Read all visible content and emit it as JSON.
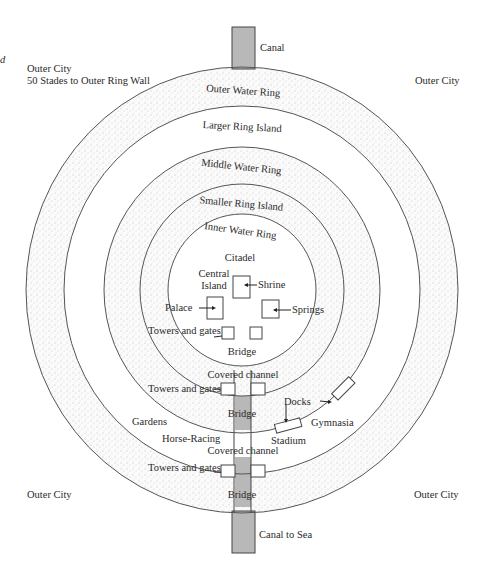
{
  "diagram": {
    "title_fragment": "d",
    "labels": {
      "outer_city_tl": "Outer City",
      "outer_wall_note": "50 Stades to Outer Ring Wall",
      "outer_city_tr": "Outer City",
      "outer_city_bl": "Outer City",
      "outer_city_br": "Outer City",
      "canal": "Canal",
      "canal_to_sea": "Canal to Sea"
    },
    "rings": [
      {
        "name": "Outer Water Ring",
        "stippled": true
      },
      {
        "name": "Larger Ring Island",
        "stippled": false
      },
      {
        "name": "Middle Water Ring",
        "stippled": true
      },
      {
        "name": "Smaller Ring Island",
        "stippled": true
      },
      {
        "name": "Inner Water Ring",
        "stippled": true
      }
    ],
    "citadel": {
      "title": "Citadel",
      "central_island_line1": "Central",
      "central_island_line2": "Island",
      "shrine": "Shrine",
      "springs": "Springs",
      "palace": "Palace"
    },
    "features": {
      "towers_gates": "Towers and gates",
      "bridge": "Bridge",
      "covered_channel": "Covered channel",
      "gardens": "Gardens",
      "horse_racing": "Horse-Racing",
      "docks": "Docks",
      "stadium": "Stadium",
      "gymnasia": "Gymnasia"
    },
    "colors": {
      "canal": "#b8b8b8",
      "stipple": "#c8c8c8",
      "line": "#555555"
    }
  }
}
